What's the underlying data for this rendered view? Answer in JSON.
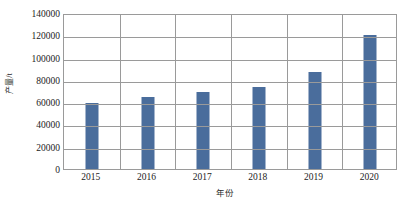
{
  "chart_data": {
    "type": "bar",
    "title": "",
    "xlabel": "年份",
    "ylabel": "产量/t",
    "categories": [
      "2015",
      "2016",
      "2017",
      "2018",
      "2019",
      "2020"
    ],
    "values": [
      59000,
      65000,
      69000,
      74000,
      87000,
      120000
    ],
    "series": [
      {
        "name": "产量",
        "values": [
          59000,
          65000,
          69000,
          74000,
          87000,
          120000
        ]
      }
    ],
    "ylim": [
      0,
      140000
    ],
    "ytick_labels": [
      "140000",
      "120000",
      "100000",
      "80000",
      "60000",
      "40000",
      "20000",
      "0"
    ],
    "ytick_values": [
      140000,
      120000,
      100000,
      80000,
      60000,
      40000,
      20000,
      0
    ],
    "ytick_step": 20000,
    "grid": "horizontal-and-vertical",
    "legend": "none",
    "bar_color": "#4a6d9c",
    "grid_color": "#9a9a9a",
    "plot_background": "#ffffff"
  }
}
